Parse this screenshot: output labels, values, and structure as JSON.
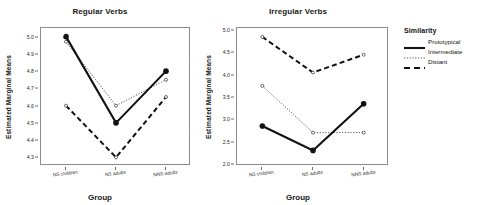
{
  "legend": {
    "title": "Similarity",
    "entries": [
      {
        "label": "Prototypical",
        "style": "solid"
      },
      {
        "label": "Intermediate",
        "style": "dotted"
      },
      {
        "label": "Distant",
        "style": "dashed"
      }
    ]
  },
  "chart_data": [
    {
      "type": "line",
      "title": "Regular Verbs",
      "xlabel": "Group",
      "ylabel": "Estimated Marginal Means",
      "categories": [
        "NS children",
        "NS adults",
        "NNS adults"
      ],
      "ylim": [
        4.25,
        5.05
      ],
      "yticks": [
        "4.3",
        "4.4",
        "4.5",
        "4.6",
        "4.7",
        "4.8",
        "4.9",
        "5.0"
      ],
      "grid": false,
      "legend_position": "right",
      "series": [
        {
          "name": "Prototypical",
          "style": "solid",
          "values": [
            5.0,
            4.5,
            4.8
          ]
        },
        {
          "name": "Intermediate",
          "style": "dotted",
          "values": [
            4.97,
            4.6,
            4.75
          ]
        },
        {
          "name": "Distant",
          "style": "dashed",
          "values": [
            4.6,
            4.3,
            4.65
          ]
        }
      ]
    },
    {
      "type": "line",
      "title": "Irregular Verbs",
      "xlabel": "Group",
      "ylabel": "Estimated Marginal Means",
      "categories": [
        "NS children",
        "NS adults",
        "NNS adults"
      ],
      "ylim": [
        1.95,
        5.05
      ],
      "yticks": [
        "2.0",
        "2.5",
        "3.0",
        "3.5",
        "4.0",
        "4.5",
        "5.0"
      ],
      "grid": false,
      "legend_position": "right",
      "series": [
        {
          "name": "Prototypical",
          "style": "solid",
          "values": [
            2.85,
            2.3,
            3.35
          ]
        },
        {
          "name": "Intermediate",
          "style": "dotted",
          "values": [
            3.75,
            2.7,
            2.7
          ]
        },
        {
          "name": "Distant",
          "style": "dashed",
          "values": [
            4.85,
            4.05,
            4.45
          ]
        }
      ]
    }
  ]
}
